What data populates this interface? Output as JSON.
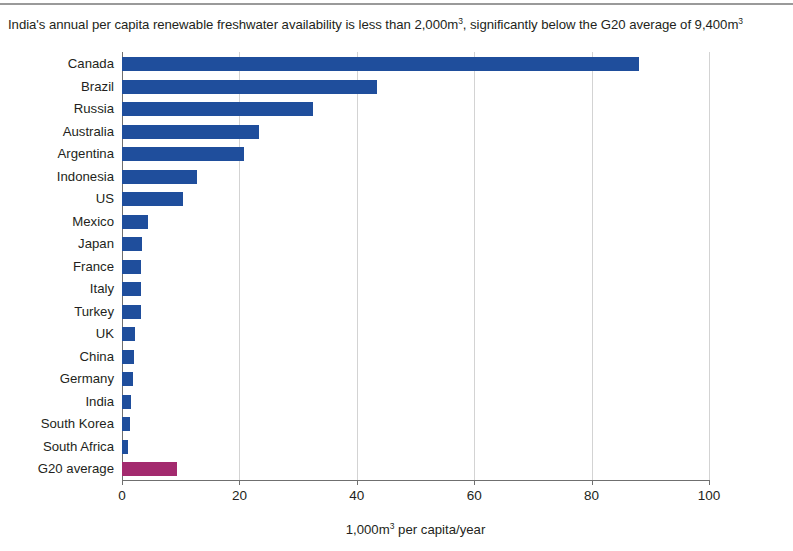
{
  "title": {
    "prefix": "India's annual per capita renewable freshwater availability is less than 2,000m",
    "sup1": "3",
    "middle": ", significantly below the G20 average of 9,400m",
    "sup2": "3"
  },
  "xaxis": {
    "label_prefix": "1,000m",
    "label_sup": "3",
    "label_suffix": " per capita/year",
    "ticks": [
      "0",
      "20",
      "40",
      "60",
      "80",
      "100"
    ]
  },
  "colors": {
    "bar_blue": "#1f4e9c",
    "bar_magenta": "#a32a6e",
    "gridline": "#d3d3d3",
    "axis": "#6f6f6f",
    "text": "#231f20"
  },
  "chart_data": {
    "type": "bar",
    "orientation": "horizontal",
    "title": "India's annual per capita renewable freshwater availability is less than 2,000m3, significantly below the G20 average of 9,400m3",
    "xlabel": "1,000m3 per capita/year",
    "ylabel": "",
    "xlim": [
      0,
      100
    ],
    "xticks": [
      0,
      20,
      40,
      60,
      80,
      100
    ],
    "grid": true,
    "legend": "none",
    "units": "1,000 m3 per capita/year",
    "categories": [
      "Canada",
      "Brazil",
      "Russia",
      "Australia",
      "Argentina",
      "Indonesia",
      "US",
      "Mexico",
      "Japan",
      "France",
      "Italy",
      "Turkey",
      "UK",
      "China",
      "Germany",
      "India",
      "South Korea",
      "South Africa",
      "G20 average"
    ],
    "values": [
      88.0,
      43.5,
      32.5,
      23.3,
      20.8,
      12.8,
      10.4,
      4.5,
      3.4,
      3.3,
      3.2,
      3.3,
      2.2,
      2.1,
      1.8,
      1.5,
      1.4,
      1.0,
      9.4
    ],
    "bar_colors": [
      "#1f4e9c",
      "#1f4e9c",
      "#1f4e9c",
      "#1f4e9c",
      "#1f4e9c",
      "#1f4e9c",
      "#1f4e9c",
      "#1f4e9c",
      "#1f4e9c",
      "#1f4e9c",
      "#1f4e9c",
      "#1f4e9c",
      "#1f4e9c",
      "#1f4e9c",
      "#1f4e9c",
      "#1f4e9c",
      "#1f4e9c",
      "#1f4e9c",
      "#a32a6e"
    ]
  }
}
